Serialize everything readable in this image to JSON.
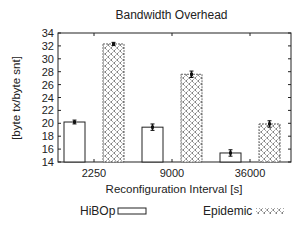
{
  "chart_data": {
    "type": "bar",
    "title": "Bandwidth Overhead",
    "xlabel": "Reconfiguration Interval [s]",
    "ylabel": "[byte tx/byte snt]",
    "categories": [
      "2250",
      "9000",
      "36000"
    ],
    "series": [
      {
        "name": "HiBOp",
        "values": [
          20.2,
          19.4,
          15.4
        ],
        "errors": [
          0.3,
          0.5,
          0.5
        ],
        "fill": "white"
      },
      {
        "name": "Epidemic",
        "values": [
          32.3,
          27.6,
          19.9
        ],
        "errors": [
          0.25,
          0.5,
          0.5
        ],
        "fill": "crosshatch"
      }
    ],
    "ylim": [
      14,
      34
    ],
    "yticks": [
      14,
      16,
      18,
      20,
      22,
      24,
      26,
      28,
      30,
      32,
      34
    ],
    "grid": false,
    "legend_position": "bottom"
  },
  "colors": {
    "axis": "#222222",
    "bar_stroke": "#222222",
    "pattern": "#333333",
    "background": "#ffffff"
  }
}
